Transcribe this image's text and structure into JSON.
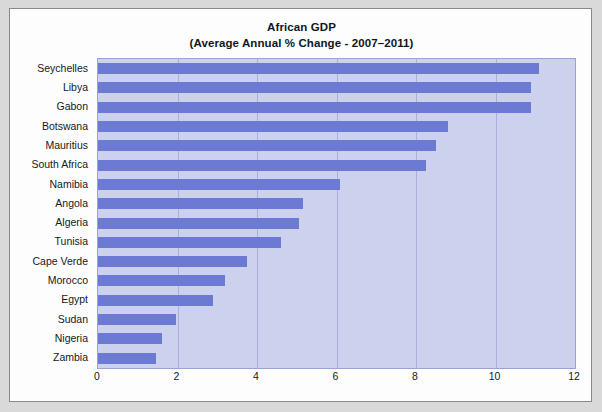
{
  "chart_data": {
    "type": "bar",
    "orientation": "horizontal",
    "title": "African GDP",
    "subtitle": "(Average Annual % Change - 2007–2011)",
    "xlabel": "",
    "ylabel": "",
    "xlim": [
      0,
      12
    ],
    "xticks": [
      0,
      2,
      4,
      6,
      8,
      10,
      12
    ],
    "grid": true,
    "legend": false,
    "bar_color": "#6c7ad3",
    "plot_background": "#ccd2ee",
    "categories": [
      "Seychelles",
      "Libya",
      "Gabon",
      "Botswana",
      "Mauritius",
      "South Africa",
      "Namibia",
      "Angola",
      "Algeria",
      "Tunisia",
      "Cape Verde",
      "Morocco",
      "Egypt",
      "Sudan",
      "Nigeria",
      "Zambia"
    ],
    "values": [
      11.1,
      10.9,
      10.9,
      8.8,
      8.5,
      8.25,
      6.1,
      5.15,
      5.05,
      4.6,
      3.75,
      3.2,
      2.9,
      1.95,
      1.6,
      1.45
    ]
  }
}
